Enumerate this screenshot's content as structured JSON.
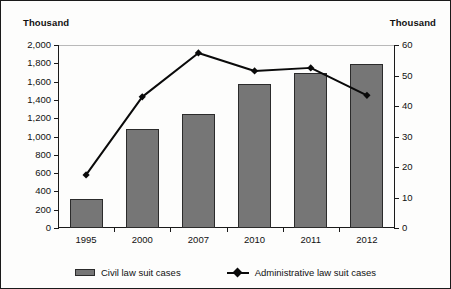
{
  "axis_unit_left": "Thousand",
  "axis_unit_right": "Thousand",
  "legend": {
    "bar_label": "Civil law suit cases",
    "line_label": "Administrative law suit cases",
    "bar_swatch_icon": "bar-swatch-icon",
    "line_swatch_icon": "line-diamond-swatch-icon"
  },
  "colors": {
    "bar_fill": "#767676",
    "bar_stroke": "#2b2b2b",
    "line": "#0a0a0a",
    "axis": "#1a1a1a",
    "text": "#111111",
    "background": "#fdfdfc"
  },
  "chart_data": {
    "type": "bar",
    "title": "",
    "xlabel": "",
    "ylabel": "Thousand",
    "y2label": "Thousand",
    "categories": [
      "1995",
      "2000",
      "2007",
      "2010",
      "2011",
      "2012"
    ],
    "ylim": [
      0,
      2000
    ],
    "y2lim": [
      0,
      60
    ],
    "yticks": [
      0,
      200,
      400,
      600,
      800,
      1000,
      1200,
      1400,
      1600,
      1800,
      2000
    ],
    "ytick_labels": [
      "0",
      "200",
      "400",
      "600",
      "800",
      "1,000",
      "1,200",
      "1,400",
      "1,600",
      "1,800",
      "2,000"
    ],
    "y2ticks": [
      0,
      10,
      20,
      30,
      40,
      50,
      60
    ],
    "y2tick_labels": [
      "0",
      "10",
      "20",
      "30",
      "40",
      "50",
      "60"
    ],
    "grid": false,
    "legend_position": "bottom",
    "series": [
      {
        "name": "Civil law suit cases",
        "type": "bar",
        "axis": "left",
        "values": [
          320,
          1082,
          1246,
          1574,
          1694,
          1792
        ]
      },
      {
        "name": "Administrative law suit cases",
        "type": "line",
        "axis": "right",
        "marker": "diamond",
        "values": [
          17.4,
          43.0,
          57.4,
          51.5,
          52.5,
          43.5
        ]
      }
    ]
  }
}
